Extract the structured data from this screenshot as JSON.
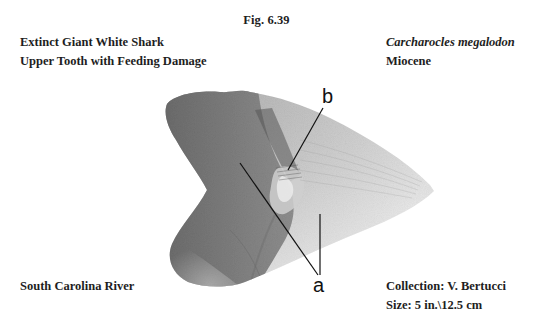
{
  "figure": {
    "number": "Fig. 6.39",
    "image_description": "Fossil shark tooth photograph with callout labels",
    "callouts": {
      "b": "b",
      "a": "a"
    }
  },
  "captions": {
    "top_left": {
      "line1": "Extinct Giant White Shark",
      "line2": "Upper Tooth with Feeding Damage"
    },
    "top_right": {
      "line1": "Carcharocles megalodon",
      "line2": "Miocene"
    },
    "bottom_left": {
      "line1": "South Carolina River"
    },
    "bottom_right": {
      "line1": "Collection: V. Bertucci",
      "line2": "Size: 5 in.\\12.5 cm"
    }
  }
}
